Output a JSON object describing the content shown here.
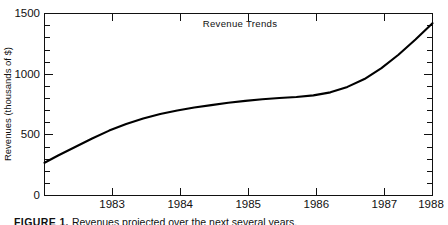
{
  "figure": {
    "caption_label": "FIGURE 1.",
    "caption_text": "Revenues projected over the next several years."
  },
  "chart_data": {
    "type": "line",
    "title": "Revenue Trends",
    "xlabel": "",
    "ylabel": "Revenues (thousands of $)",
    "xlim": [
      1982.3,
      1988.0
    ],
    "ylim": [
      0,
      1500
    ],
    "grid": false,
    "legend": "none",
    "y_ticks_major": [
      0,
      500,
      1000,
      1500
    ],
    "y_tick_labels": [
      "0",
      "500",
      "1000",
      "1500"
    ],
    "y_ticks_minor": [
      100,
      200,
      300,
      400,
      600,
      700,
      800,
      900,
      1100,
      1200,
      1300,
      1400
    ],
    "x_ticks": [
      1983,
      1984,
      1985,
      1986,
      1987,
      1988
    ],
    "x_tick_labels": [
      "1983",
      "1984",
      "1985",
      "1986",
      "1987",
      "1988"
    ],
    "series": [
      {
        "name": "Revenues",
        "color": "#000000",
        "x": [
          1982.3,
          1982.5,
          1982.75,
          1983.0,
          1983.25,
          1983.5,
          1983.75,
          1984.0,
          1984.25,
          1984.5,
          1984.75,
          1985.0,
          1985.25,
          1985.5,
          1985.75,
          1986.0,
          1986.25,
          1986.5,
          1986.75,
          1987.0,
          1987.25,
          1987.5,
          1987.75,
          1988.0
        ],
        "values": [
          270,
          330,
          400,
          470,
          535,
          590,
          635,
          672,
          700,
          725,
          745,
          765,
          780,
          793,
          803,
          812,
          825,
          850,
          895,
          960,
          1050,
          1160,
          1285,
          1420
        ]
      }
    ]
  }
}
